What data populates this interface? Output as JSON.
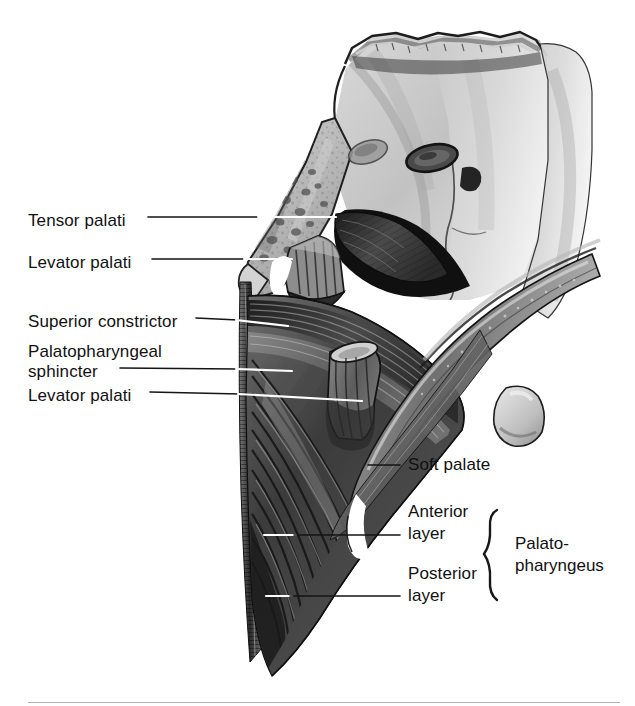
{
  "figure": {
    "type": "anatomical-illustration",
    "style": "grayscale medical illustration",
    "background_color": "#ffffff",
    "ink_color": "#111111"
  },
  "labels_left": [
    {
      "id": "tensor-palati",
      "text": "Tensor palati",
      "x": 28,
      "y": 211
    },
    {
      "id": "levator-palati-upper",
      "text": "Levator palati",
      "x": 28,
      "y": 253
    },
    {
      "id": "superior-constrictor",
      "text": "Superior constrictor",
      "x": 28,
      "y": 312
    },
    {
      "id": "palatopharyngeal-line1",
      "text": "Palatopharyngeal",
      "x": 28,
      "y": 342
    },
    {
      "id": "palatopharyngeal-line2",
      "text": "sphincter",
      "x": 28,
      "y": 362
    },
    {
      "id": "levator-palati-lower",
      "text": "Levator palati",
      "x": 28,
      "y": 386
    }
  ],
  "labels_right": [
    {
      "id": "soft-palate",
      "text": "Soft palate",
      "x": 408,
      "y": 455
    },
    {
      "id": "anterior-layer-1",
      "text": "Anterior",
      "x": 408,
      "y": 502
    },
    {
      "id": "anterior-layer-2",
      "text": "layer",
      "x": 408,
      "y": 524
    },
    {
      "id": "posterior-layer-1",
      "text": "Posterior",
      "x": 408,
      "y": 564
    },
    {
      "id": "posterior-layer-2",
      "text": "layer",
      "x": 408,
      "y": 586
    }
  ],
  "brace_group": {
    "line1": "Palato-",
    "line2": "pharyngeus",
    "x": 515,
    "y": 533,
    "brace_top": 510,
    "brace_bottom": 600
  },
  "leader_lines": [
    {
      "id": "leader-tensor-palati",
      "x1": 148,
      "y1": 217,
      "x2": 336,
      "y2": 217
    },
    {
      "id": "leader-levator-palati-upper",
      "x1": 152,
      "y1": 259,
      "x2": 292,
      "y2": 259
    },
    {
      "id": "leader-superior-constrictor",
      "x1": 196,
      "y1": 318,
      "x2": 286,
      "y2": 326
    },
    {
      "id": "leader-palatopharyngeal",
      "x1": 120,
      "y1": 368,
      "x2": 290,
      "y2": 370
    },
    {
      "id": "leader-levator-palati-lower",
      "x1": 150,
      "y1": 392,
      "x2": 362,
      "y2": 400
    },
    {
      "id": "leader-soft-palate",
      "x1": 372,
      "y1": 465,
      "x2": 400,
      "y2": 465
    },
    {
      "id": "leader-anterior-layer",
      "x1": 264,
      "y1": 535,
      "x2": 400,
      "y2": 535
    },
    {
      "id": "leader-posterior-layer",
      "x1": 266,
      "y1": 596,
      "x2": 400,
      "y2": 596
    }
  ],
  "footer": {
    "rule_visible": true
  }
}
